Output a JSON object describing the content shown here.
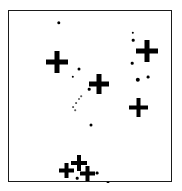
{
  "figure": {
    "title": "",
    "width": 182,
    "height": 191,
    "background_color": "#ffffff",
    "frame": {
      "border_color": "#1a1a1a",
      "border_width_px": 1.5,
      "left": 8,
      "top": 10,
      "width": 164,
      "height": 172
    }
  },
  "chart_data": {
    "type": "scatter",
    "title": "",
    "subtitle": "",
    "xlabel": "",
    "ylabel": "",
    "xlim": [
      0,
      164
    ],
    "ylim": [
      0,
      172
    ],
    "grid": false,
    "legend": null,
    "axis_ticks": {
      "x": [],
      "y": []
    },
    "marker_color": "#000000",
    "series": [
      {
        "name": "cross-markers",
        "marker": "plus",
        "color": "#000000",
        "points": [
          {
            "label": "cross-left-upper",
            "x": 48,
            "y": 51,
            "arm": 22,
            "thickness": 5
          },
          {
            "label": "cross-center",
            "x": 90,
            "y": 73,
            "arm": 20,
            "thickness": 5
          },
          {
            "label": "cross-right-upper",
            "x": 138,
            "y": 40,
            "arm": 22,
            "thickness": 5
          },
          {
            "label": "cross-right-lower",
            "x": 129,
            "y": 96,
            "arm": 19,
            "thickness": 4
          },
          {
            "label": "cross-bottom-left",
            "x": 57,
            "y": 159,
            "arm": 15,
            "thickness": 4
          },
          {
            "label": "cross-bottom-mid-upper",
            "x": 70,
            "y": 152,
            "arm": 16,
            "thickness": 4
          },
          {
            "label": "cross-bottom-mid-lower",
            "x": 78,
            "y": 162,
            "arm": 15,
            "thickness": 4
          }
        ]
      },
      {
        "name": "dot-markers",
        "marker": "dot",
        "color": "#000000",
        "points": [
          {
            "label": "dot-top",
            "x": 50,
            "y": 12,
            "size": 3.4
          },
          {
            "label": "dot-upper-right-a",
            "x": 124,
            "y": 22,
            "size": 2.4
          },
          {
            "label": "dot-upper-right-b",
            "x": 124,
            "y": 29,
            "size": 2.6
          },
          {
            "label": "dot-mid-left-a",
            "x": 70,
            "y": 58,
            "size": 3.0
          },
          {
            "label": "dot-mid-left-b",
            "x": 64,
            "y": 66,
            "size": 2.4
          },
          {
            "label": "dot-mid-center",
            "x": 80,
            "y": 78,
            "size": 2.6
          },
          {
            "label": "dot-right-mid",
            "x": 123,
            "y": 52,
            "size": 2.6
          },
          {
            "label": "dot-right-large",
            "x": 129,
            "y": 69,
            "size": 4.4
          },
          {
            "label": "dot-right-small",
            "x": 139,
            "y": 66,
            "size": 2.8
          },
          {
            "label": "dot-center-low",
            "x": 82,
            "y": 114,
            "size": 3.0
          },
          {
            "label": "dot-bottom-a",
            "x": 68,
            "y": 167,
            "size": 2.6
          },
          {
            "label": "dot-bottom-b",
            "x": 88,
            "y": 162,
            "size": 2.8
          },
          {
            "label": "dot-bottom-c",
            "x": 99,
            "y": 172,
            "size": 3.0
          }
        ]
      },
      {
        "name": "faint-streak",
        "marker": "dot",
        "color": "#5a5a5a",
        "points": [
          {
            "label": "streak-a",
            "x": 64,
            "y": 96,
            "size": 1.8
          },
          {
            "label": "streak-b",
            "x": 67,
            "y": 92,
            "size": 1.8
          },
          {
            "label": "streak-c",
            "x": 70,
            "y": 88,
            "size": 2.0
          },
          {
            "label": "streak-d",
            "x": 66,
            "y": 99,
            "size": 1.6
          },
          {
            "label": "streak-e",
            "x": 72,
            "y": 85,
            "size": 1.6
          }
        ]
      }
    ]
  }
}
